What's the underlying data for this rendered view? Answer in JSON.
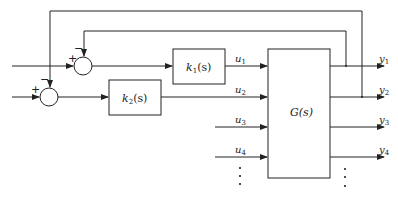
{
  "blocks": {
    "k1": {
      "name": "k",
      "sub": "1",
      "arg": "(s)"
    },
    "k2": {
      "name": "k",
      "sub": "2",
      "arg": "(s)"
    },
    "G": {
      "label": "G(s)"
    }
  },
  "signals": {
    "u1": {
      "name": "u",
      "sub": "1"
    },
    "u2": {
      "name": "u",
      "sub": "2"
    },
    "u3": {
      "name": "u",
      "sub": "3"
    },
    "u4": {
      "name": "u",
      "sub": "4"
    },
    "y1": {
      "name": "y",
      "sub": "1"
    },
    "y2": {
      "name": "y",
      "sub": "2"
    },
    "y3": {
      "name": "y",
      "sub": "3"
    },
    "y4": {
      "name": "y",
      "sub": "4"
    }
  },
  "junctions": {
    "sum1": {
      "plus": "+",
      "minus": "−"
    },
    "sum2": {
      "plus": "+",
      "minus": "−"
    }
  },
  "ellipsis": "⋮"
}
